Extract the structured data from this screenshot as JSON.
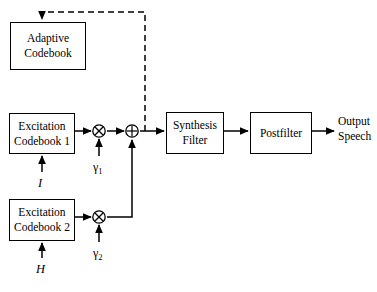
{
  "diagram": {
    "background_color": "#ffffff",
    "line_color": "#000000",
    "blocks": [
      {
        "id": "adaptive_codebook",
        "label": "Adaptive\nCodebook",
        "line1": "Adaptive",
        "line2": "Codebook",
        "x": 10,
        "y": 22,
        "w": 76,
        "h": 48
      },
      {
        "id": "excitation_codebook_1",
        "label": "Excitation\nCodebook 1",
        "line1": "Excitation",
        "line2": "Codebook 1",
        "x": 9,
        "y": 113,
        "w": 66,
        "h": 41
      },
      {
        "id": "excitation_codebook_2",
        "label": "Excitation\nCodebook 2",
        "line1": "Excitation",
        "line2": "Codebook 2",
        "x": 9,
        "y": 199,
        "w": 66,
        "h": 42
      },
      {
        "id": "synthesis_filter",
        "label": "Synthesis\nFilter",
        "line1": "Synthesis",
        "line2": "Filter",
        "x": 166,
        "y": 112,
        "w": 58,
        "h": 42
      },
      {
        "id": "postfilter",
        "label": "Postfilter",
        "line1": "Postfilter",
        "line2": "",
        "x": 250,
        "y": 112,
        "w": 62,
        "h": 42
      }
    ],
    "operators": [
      {
        "id": "gain_multiplier_1",
        "symbol": "multiply",
        "glyph": "⊗",
        "cx": 99,
        "cy": 131
      },
      {
        "id": "summing_junction",
        "symbol": "add",
        "glyph": "⊕",
        "cx": 132,
        "cy": 131
      },
      {
        "id": "gain_multiplier_2",
        "symbol": "multiply",
        "glyph": "⊗",
        "cx": 99,
        "cy": 217
      }
    ],
    "labels": [
      {
        "id": "gain_1",
        "text": "γ",
        "subscript": "1",
        "x": 93,
        "y": 160
      },
      {
        "id": "gain_2",
        "text": "γ",
        "subscript": "2",
        "x": 93,
        "y": 246
      },
      {
        "id": "index_I",
        "text": "I",
        "subscript": "",
        "x": 38,
        "y": 176
      },
      {
        "id": "index_H",
        "text": "H",
        "subscript": "",
        "x": 36,
        "y": 262
      },
      {
        "id": "output_speech_1",
        "text": "Output",
        "subscript": "",
        "x": 338,
        "y": 116
      },
      {
        "id": "output_speech_2",
        "text": "Speech",
        "subscript": "",
        "x": 338,
        "y": 132
      }
    ],
    "connections": [
      {
        "id": "cb1-to-mult1",
        "from": "excitation_codebook_1",
        "to": "gain_multiplier_1",
        "style": "solid",
        "arrow": true
      },
      {
        "id": "mult1-to-sum",
        "from": "gain_multiplier_1",
        "to": "summing_junction",
        "style": "solid",
        "arrow": true
      },
      {
        "id": "sum-to-synthesis",
        "from": "summing_junction",
        "to": "synthesis_filter",
        "style": "solid",
        "arrow": true
      },
      {
        "id": "synthesis-to-postfilter",
        "from": "synthesis_filter",
        "to": "postfilter",
        "style": "solid",
        "arrow": true
      },
      {
        "id": "postfilter-to-output",
        "from": "postfilter",
        "to": "output_speech",
        "style": "solid",
        "arrow": true
      },
      {
        "id": "cb2-to-mult2",
        "from": "excitation_codebook_2",
        "to": "gain_multiplier_2",
        "style": "solid",
        "arrow": true
      },
      {
        "id": "mult2-to-sum",
        "from": "gain_multiplier_2",
        "to": "summing_junction",
        "style": "solid",
        "arrow": true
      },
      {
        "id": "gain1-to-mult1",
        "from": "gain_1",
        "to": "gain_multiplier_1",
        "style": "solid",
        "arrow": true
      },
      {
        "id": "gain2-to-mult2",
        "from": "gain_2",
        "to": "gain_multiplier_2",
        "style": "solid",
        "arrow": true
      },
      {
        "id": "index-I-to-cb1",
        "from": "index_I",
        "to": "excitation_codebook_1",
        "style": "solid",
        "arrow": true
      },
      {
        "id": "index-H-to-cb2",
        "from": "index_H",
        "to": "excitation_codebook_2",
        "style": "solid",
        "arrow": true
      },
      {
        "id": "excitation-feedback",
        "from": "summing_junction",
        "to": "adaptive_codebook",
        "style": "dashed",
        "arrow": true
      }
    ]
  }
}
